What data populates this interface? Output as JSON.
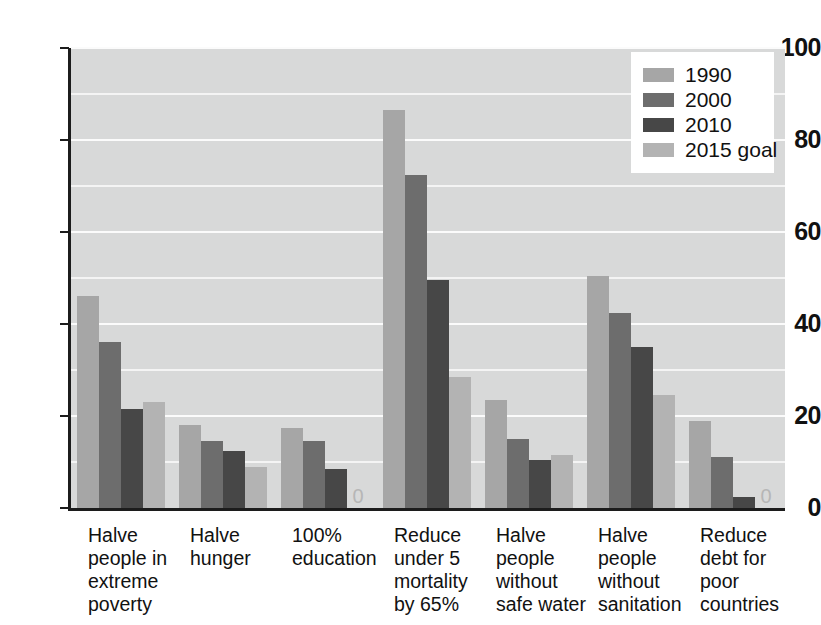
{
  "chart_data": {
    "type": "bar",
    "title": "",
    "xlabel": "",
    "ylabel": "",
    "ylim": [
      0,
      100
    ],
    "yticks": [
      0,
      20,
      40,
      60,
      80,
      100
    ],
    "ytick_labels": [
      "0",
      "20",
      "40",
      "60",
      "80",
      "100"
    ],
    "grid": true,
    "gridlines_minor": [
      10,
      30,
      50,
      70,
      90
    ],
    "legend_position": "top-right",
    "categories": [
      "Halve people in extreme poverty",
      "Halve hunger",
      "100% education",
      "Reduce under 5 mortality by 65%",
      "Halve people without safe water",
      "Halve people without sanitation",
      "Reduce debt for poor countries"
    ],
    "category_lines": [
      [
        "Halve",
        "people in",
        "extreme",
        "poverty"
      ],
      [
        "Halve",
        "hunger"
      ],
      [
        "100%",
        "education"
      ],
      [
        "Reduce",
        "under 5",
        "mortality",
        "by 65%"
      ],
      [
        "Halve",
        "people",
        "without",
        "safe water"
      ],
      [
        "Halve",
        "people",
        "without",
        "sanitation"
      ],
      [
        "Reduce",
        "debt for",
        "poor",
        "countries"
      ]
    ],
    "series": [
      {
        "name": "1990",
        "color": "#a6a6a6",
        "values": [
          46,
          18,
          17.5,
          86.5,
          23.5,
          50.5,
          19
        ]
      },
      {
        "name": "2000",
        "color": "#6d6d6d",
        "values": [
          36,
          14.5,
          14.5,
          72.5,
          15,
          42.5,
          11
        ]
      },
      {
        "name": "2010",
        "color": "#474747",
        "values": [
          21.5,
          12.5,
          8.5,
          49.5,
          10.5,
          35,
          2.5
        ]
      },
      {
        "name": "2015 goal",
        "color": "#b3b3b3",
        "values": [
          23,
          9,
          0,
          28.5,
          11.5,
          24.5,
          0
        ]
      }
    ],
    "zero_value_labels": [
      {
        "group": 2,
        "series": 3,
        "text": "0"
      },
      {
        "group": 6,
        "series": 3,
        "text": "0"
      }
    ],
    "colors": {
      "plot_background": "#d8d9d9",
      "gridline": "#f4f4f4",
      "axis": "#1c1c1c",
      "page_background": "#ffffff",
      "text": "#111111",
      "zero_label": "#b6b6b6"
    }
  },
  "legend": {
    "items": [
      {
        "label": "1990",
        "color": "#a6a6a6"
      },
      {
        "label": "2000",
        "color": "#6d6d6d"
      },
      {
        "label": "2010",
        "color": "#474747"
      },
      {
        "label": "2015 goal",
        "color": "#b3b3b3"
      }
    ]
  }
}
